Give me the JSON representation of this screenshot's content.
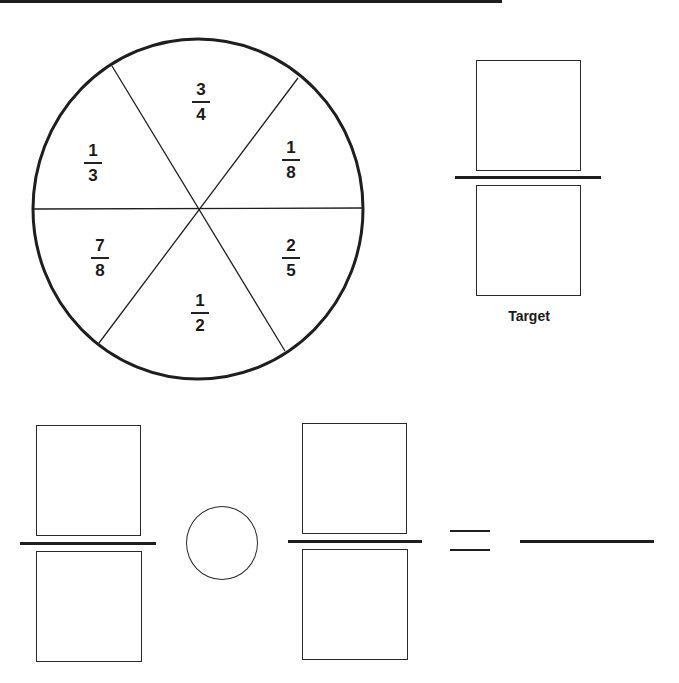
{
  "spinner": {
    "sections": [
      {
        "position": "top",
        "numerator": "3",
        "denominator": "4"
      },
      {
        "position": "upper-right",
        "numerator": "1",
        "denominator": "8"
      },
      {
        "position": "lower-right",
        "numerator": "2",
        "denominator": "5"
      },
      {
        "position": "bottom",
        "numerator": "1",
        "denominator": "2"
      },
      {
        "position": "lower-left",
        "numerator": "7",
        "denominator": "8"
      },
      {
        "position": "upper-left",
        "numerator": "1",
        "denominator": "3"
      }
    ]
  },
  "target": {
    "label": "Target",
    "numerator": "",
    "denominator": ""
  },
  "equation": {
    "fraction1": {
      "numerator": "",
      "denominator": ""
    },
    "operator": "",
    "fraction2": {
      "numerator": "",
      "denominator": ""
    },
    "equals": "=",
    "answer": ""
  }
}
